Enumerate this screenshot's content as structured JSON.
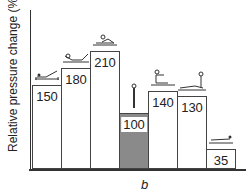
{
  "chart_data": {
    "type": "bar",
    "title": "",
    "xlabel": "",
    "ylabel": "Relative pressure change (%)",
    "subplot_label": "b",
    "categories": [
      "reclined, legs raised",
      "supine reclined",
      "supine lying",
      "standing",
      "sitting on bed",
      "side-lying",
      "prone lying"
    ],
    "values": [
      150,
      180,
      210,
      100,
      140,
      130,
      35
    ],
    "reference_index": 3,
    "colors": {
      "bar": "#ffffff",
      "reference_bar": "#8a8a8a",
      "edge": "#444444"
    },
    "ylim": [
      0,
      240
    ],
    "grid": false,
    "legend": "none"
  }
}
